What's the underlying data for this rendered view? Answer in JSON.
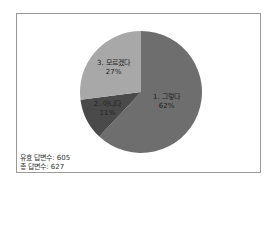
{
  "chart_data": {
    "type": "pie",
    "title": "",
    "categories": [
      "1. 그렇다",
      "2. 아니다",
      "3. 모르겠다"
    ],
    "values": [
      62,
      11,
      27
    ],
    "unit": "%",
    "colors": [
      "#6e6e6e",
      "#4a4a4a",
      "#a8a8a8"
    ],
    "start_angle": "12 o'clock, clockwise",
    "legend": "none (inline data labels)",
    "annotations": [
      "유효 답변수: 605",
      "총 답변수: 627"
    ]
  },
  "labels": [
    {
      "name": "1. 그렇다",
      "pct": "62%"
    },
    {
      "name": "2. 아니다",
      "pct": "11%"
    },
    {
      "name": "3. 모르겠다",
      "pct": "27%"
    }
  ],
  "footnote": {
    "valid": "유효 답변수: 605",
    "total": "총 답변수: 627"
  }
}
